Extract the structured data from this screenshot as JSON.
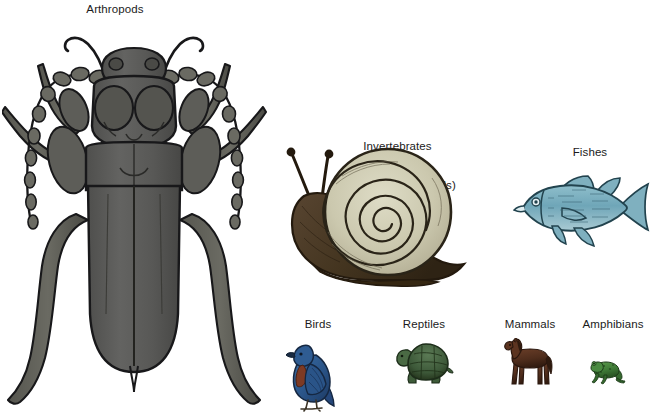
{
  "figure": {
    "background_color": "#ffffff",
    "text_color": "#1b1b1b",
    "caption_note": "Relative species diversity of major animal groups, drawn to scale"
  },
  "groups": [
    {
      "key": "arthropods",
      "label": "Arthropods",
      "organism": "beetle-illustration",
      "color": "#5a5a58",
      "outline_color": "#1c1c1c"
    },
    {
      "key": "invertebrates",
      "label_line1": "Invertebrates",
      "label_line2": "(excluding arthropods)",
      "label": "Invertebrates\n(excluding arthropods)",
      "organism": "snail-illustration",
      "shell_color": "#cfcbb4",
      "body_color": "#4a3a2a",
      "outline_color": "#20190f"
    },
    {
      "key": "fishes",
      "label": "Fishes",
      "organism": "fish-illustration",
      "color": "#6fa6b8",
      "outline_color": "#23444f"
    },
    {
      "key": "birds",
      "label": "Birds",
      "organism": "bird-illustration",
      "color": "#2c5f96",
      "accent_color": "#7d3a24",
      "outline_color": "#16243a"
    },
    {
      "key": "reptiles",
      "label": "Reptiles",
      "organism": "tortoise-illustration",
      "color": "#3f5c3c",
      "outline_color": "#1f2d1e"
    },
    {
      "key": "mammals",
      "label": "Mammals",
      "organism": "horse-illustration",
      "color": "#5a3322",
      "outline_color": "#2a170e"
    },
    {
      "key": "amphibians",
      "label": "Amphibians",
      "organism": "frog-illustration",
      "color": "#3f7a37",
      "outline_color": "#1d3a18"
    }
  ]
}
